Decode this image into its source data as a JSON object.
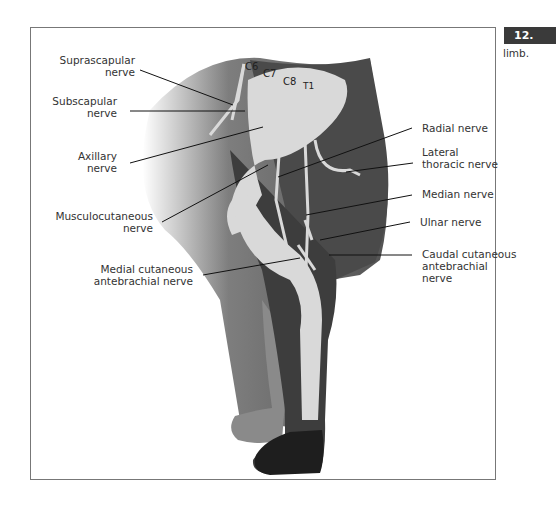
{
  "figure": {
    "side_badge": "12.",
    "side_text": "limb.",
    "roots": [
      "C6",
      "C7",
      "C8",
      "T1"
    ],
    "labels_left": [
      {
        "id": "suprascapular",
        "text": "Suprascapular\nnerve"
      },
      {
        "id": "subscapular",
        "text": "Subscapular\nnerve"
      },
      {
        "id": "axillary",
        "text": "Axillary\nnerve"
      },
      {
        "id": "musculocutaneous",
        "text": "Musculocutaneous\nnerve"
      },
      {
        "id": "medial-cutaneous-antebrachial",
        "text": "Medial cutaneous\nantebrachial nerve"
      }
    ],
    "labels_right": [
      {
        "id": "radial",
        "text": "Radial nerve"
      },
      {
        "id": "lateral-thoracic",
        "text": "Lateral\nthoracic nerve"
      },
      {
        "id": "median",
        "text": "Median nerve"
      },
      {
        "id": "ulnar",
        "text": "Ulnar nerve"
      },
      {
        "id": "caudal-cutaneous-antebrachial",
        "text": "Caudal cutaneous\nantebrachial\nnerve"
      }
    ],
    "colors": {
      "body_dark": "#4a4a4a",
      "limb_mid": "#5c5c5c",
      "limb_far": "#8a8a8a",
      "paw_dark": "#1e1e1e",
      "nerve": "#d9d9d9",
      "leader": "#111111"
    }
  }
}
